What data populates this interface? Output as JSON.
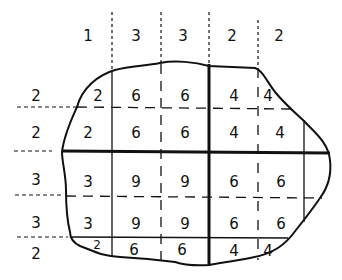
{
  "diagram": {
    "column_weights": [
      "1",
      "3",
      "3",
      "2",
      "2"
    ],
    "row_weights": [
      "2",
      "2",
      "3",
      "3",
      "2"
    ],
    "cells": [
      [
        "2",
        "6",
        "6",
        "4",
        "4"
      ],
      [
        "2",
        "6",
        "6",
        "4",
        "4"
      ],
      [
        "3",
        "9",
        "9",
        "6",
        "6"
      ],
      [
        "3",
        "9",
        "9",
        "6",
        "6"
      ],
      [
        "2",
        "6",
        "6",
        "4",
        "4"
      ]
    ],
    "colors": {
      "ink": "#111111",
      "background": "#ffffff"
    }
  }
}
